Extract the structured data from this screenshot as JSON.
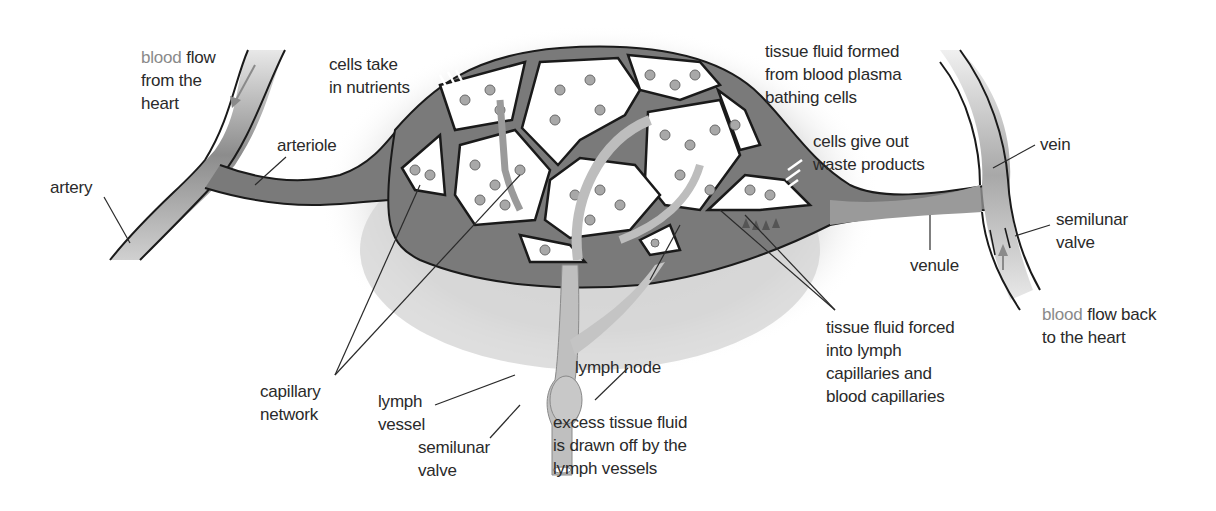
{
  "figure": {
    "type": "labelled biological diagram"
  },
  "labels": {
    "blood_flow_from_heart": {
      "highlight": "blood",
      "rest": " flow",
      "line2": "from the",
      "line3": "heart"
    },
    "cells_take_in_nutrients": {
      "line1": "cells take",
      "line2": "in nutrients"
    },
    "artery": "artery",
    "arteriole": "arteriole",
    "tissue_fluid_formed": {
      "line1": "tissue fluid formed",
      "line2": "from blood plasma",
      "line3": "bathing cells"
    },
    "cells_give_out_waste": {
      "line1": "cells give out",
      "line2": "waste products"
    },
    "vein": "vein",
    "semilunar_valve_vein": {
      "line1": "semilunar",
      "line2": "valve"
    },
    "venule": "venule",
    "blood_flow_back": {
      "highlight": "blood",
      "rest": " flow back",
      "line2": "to the heart"
    },
    "tissue_fluid_forced": {
      "line1": "tissue fluid forced",
      "line2": "into lymph",
      "line3": "capillaries and",
      "line4": "blood capillaries"
    },
    "capillary_network": {
      "line1": "capillary",
      "line2": "network"
    },
    "lymph_vessel": {
      "line1": "lymph",
      "line2": "vessel"
    },
    "lymph_node": "lymph node",
    "semilunar_valve_lymph": {
      "line1": "semilunar",
      "line2": "valve"
    },
    "excess_tissue_fluid": {
      "line1": "excess tissue fluid",
      "line2": "is drawn off by the",
      "line3": "lymph vessels"
    }
  },
  "colors": {
    "vessel_fill": "#7a7a7a",
    "vessel_light": "#b5b5b5",
    "outline": "#1a1a1a",
    "tissue_shadow": "#d8d8d8",
    "cell_fill": "#ffffff",
    "nucleus": "#a0a0a0",
    "highlight_text": "#8a8a8a",
    "text": "#2a2a2a"
  }
}
